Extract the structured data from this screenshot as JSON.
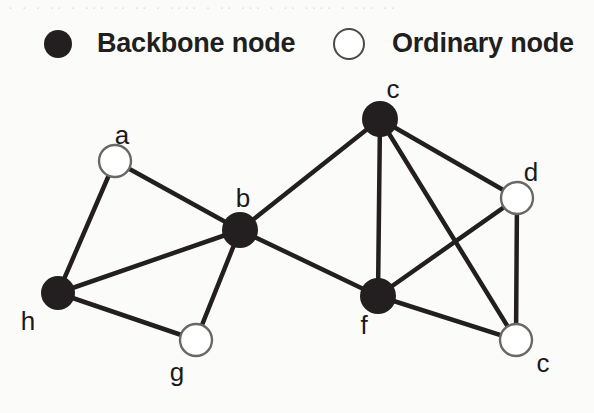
{
  "figure": {
    "width": 594,
    "height": 413,
    "background": "#fbfbfa",
    "ghost_text": "· · ·  ·· · ···  ·· ·· ·  ···· · ··  ··· · ··  ···· · ··· ··"
  },
  "legend": {
    "backbone": {
      "label": "Backbone node",
      "marker": "filled-circle",
      "color": "#231f20",
      "cx": 58,
      "cy": 44,
      "r": 14
    },
    "ordinary": {
      "label": "Ordinary node",
      "marker": "hollow-circle",
      "color": "#ffffff",
      "stroke": "#4b4a49",
      "cx": 349,
      "cy": 44,
      "r": 15
    }
  },
  "graph": {
    "type": "node-link-diagram",
    "edge_color": "#231f20",
    "edge_width": 4.5,
    "backbone_fill": "#231f20",
    "ordinary_fill": "#ffffff",
    "ordinary_stroke": "#6a6866",
    "nodes": [
      {
        "id": "a",
        "label": "a",
        "kind": "ordinary",
        "cx": 115,
        "cy": 161,
        "r": 16,
        "label_x": 122,
        "label_y": 120
      },
      {
        "id": "b",
        "label": "b",
        "kind": "backbone",
        "cx": 240,
        "cy": 230,
        "r": 18,
        "label_x": 243,
        "label_y": 183
      },
      {
        "id": "c",
        "label": "c",
        "kind": "backbone",
        "cx": 380,
        "cy": 119,
        "r": 18,
        "label_x": 393,
        "label_y": 74
      },
      {
        "id": "d",
        "label": "d",
        "kind": "ordinary",
        "cx": 517,
        "cy": 198,
        "r": 16,
        "label_x": 531,
        "label_y": 157
      },
      {
        "id": "e",
        "label": "c",
        "kind": "ordinary",
        "cx": 516,
        "cy": 340,
        "r": 16,
        "label_x": 543,
        "label_y": 348
      },
      {
        "id": "f",
        "label": "f",
        "kind": "backbone",
        "cx": 378,
        "cy": 296,
        "r": 18,
        "label_x": 364,
        "label_y": 310
      },
      {
        "id": "g",
        "label": "g",
        "kind": "ordinary",
        "cx": 196,
        "cy": 340,
        "r": 16,
        "label_x": 177,
        "label_y": 357
      },
      {
        "id": "h",
        "label": "h",
        "kind": "backbone",
        "cx": 58,
        "cy": 293,
        "r": 17,
        "label_x": 28,
        "label_y": 306
      }
    ],
    "edges": [
      {
        "source": "a",
        "target": "h"
      },
      {
        "source": "a",
        "target": "b"
      },
      {
        "source": "h",
        "target": "b"
      },
      {
        "source": "h",
        "target": "g"
      },
      {
        "source": "g",
        "target": "b"
      },
      {
        "source": "b",
        "target": "c"
      },
      {
        "source": "b",
        "target": "f"
      },
      {
        "source": "c",
        "target": "f"
      },
      {
        "source": "c",
        "target": "d"
      },
      {
        "source": "c",
        "target": "e"
      },
      {
        "source": "d",
        "target": "f"
      },
      {
        "source": "d",
        "target": "e"
      },
      {
        "source": "f",
        "target": "e"
      }
    ]
  }
}
